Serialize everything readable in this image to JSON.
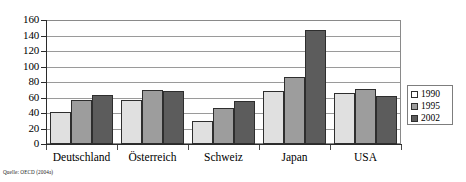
{
  "chart_data": {
    "type": "bar",
    "title": "",
    "xlabel": "",
    "ylabel": "",
    "categories": [
      "Deutschland",
      "Österreich",
      "Schweiz",
      "Japan",
      "USA"
    ],
    "series": [
      {
        "name": "1990",
        "color": "#e0e0e0",
        "values": [
          41,
          57,
          30,
          68,
          66
        ]
      },
      {
        "name": "1995",
        "color": "#9d9d9d",
        "values": [
          57,
          70,
          46,
          87,
          71
        ]
      },
      {
        "name": "2002",
        "color": "#5c5c5c",
        "values": [
          63,
          68,
          56,
          147,
          62
        ]
      }
    ],
    "ylim": [
      0,
      160
    ],
    "yticks": [
      0,
      20,
      40,
      60,
      80,
      100,
      120,
      140,
      160
    ],
    "ytick_labels": [
      "0",
      "20",
      "40",
      "60",
      "80",
      "100",
      "120",
      "140",
      "160"
    ],
    "grid": true,
    "grid_axis": "y",
    "legend_position": "right"
  },
  "legend": {
    "entries": [
      {
        "label": "1990"
      },
      {
        "label": "1995"
      },
      {
        "label": "2002"
      }
    ]
  },
  "source": {
    "text": "Quelle: OECD (2004a)"
  }
}
